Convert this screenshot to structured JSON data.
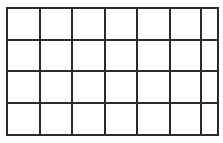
{
  "grid": {
    "rows": 4,
    "cols": 7,
    "line_color": "#2b2b2b",
    "background": "#ffffff",
    "line_width": 2,
    "x_lines": [
      7,
      40,
      72,
      105,
      137,
      170,
      201,
      218
    ],
    "y_lines": [
      8,
      40,
      71,
      103,
      135
    ]
  }
}
